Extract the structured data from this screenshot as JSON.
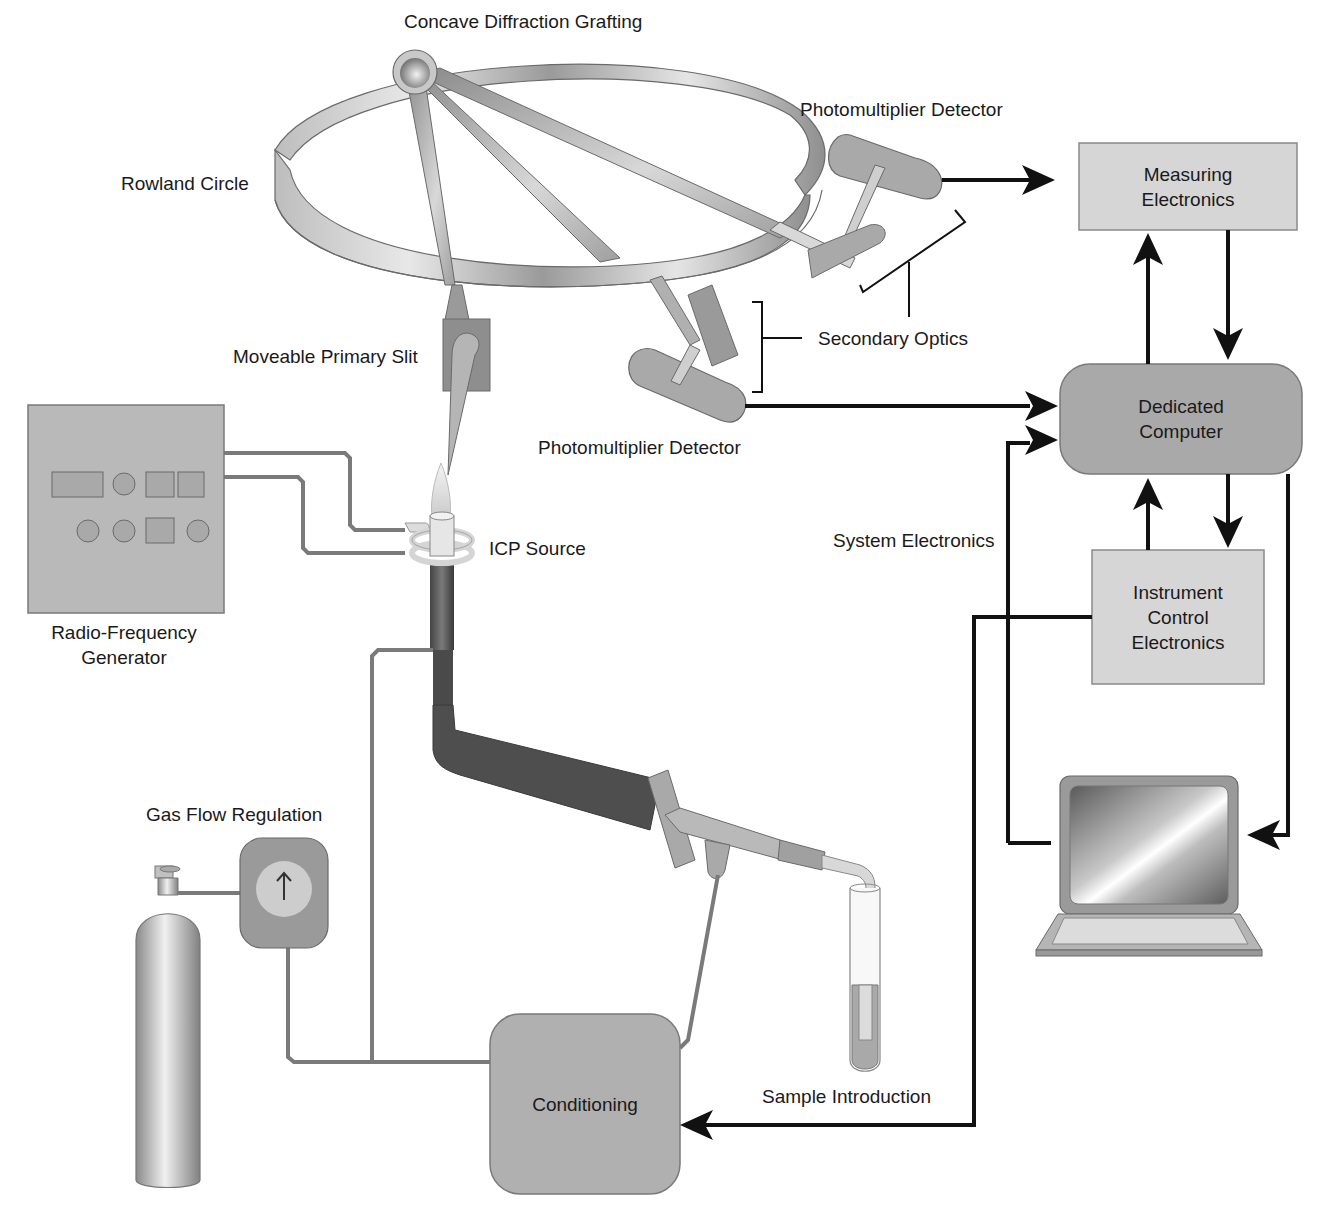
{
  "labels": {
    "grating": "Concave Diffraction Grafting",
    "rowland": "Rowland Circle",
    "pmt_top": "Photomultiplier Detector",
    "pmt_bottom": "Photomultiplier Detector",
    "secondary_optics": "Secondary Optics",
    "primary_slit": "Moveable Primary Slit",
    "rf_generator_line1": "Radio-Frequency",
    "rf_generator_line2": "Generator",
    "icp_source": "ICP Source",
    "system_electronics": "System Electronics",
    "gas_flow": "Gas Flow Regulation",
    "sample_intro": "Sample Introduction"
  },
  "boxes": {
    "measuring": [
      "Measuring",
      "Electronics"
    ],
    "dedicated": [
      "Dedicated",
      "Computer"
    ],
    "instrument": [
      "Instrument",
      "Control",
      "Electronics"
    ],
    "conditioning": [
      "Conditioning"
    ]
  },
  "colors": {
    "component_fill": "#a9a9a9",
    "box_fill": "#d6d6d6",
    "dark_fill": "#555555",
    "arrow": "#000000",
    "pipe": "#7a7a7a"
  }
}
